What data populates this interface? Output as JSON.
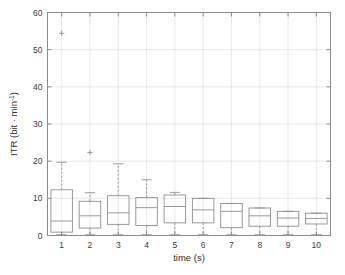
{
  "chart_data": {
    "type": "boxplot",
    "title": "",
    "xlabel": "time (s)",
    "ylabel": "ITR (bit · min⁻¹)",
    "ylabel_parts": {
      "main": "ITR (bit · min",
      "sup": "-1",
      "tail": ")"
    },
    "xlim": [
      0.5,
      10.5
    ],
    "ylim": [
      0,
      60
    ],
    "yticks": [
      0,
      10,
      20,
      30,
      40,
      50,
      60
    ],
    "ytick_labels": [
      "0",
      "10",
      "20",
      "30",
      "40",
      "50",
      "60"
    ],
    "xticks": [
      1,
      2,
      3,
      4,
      5,
      6,
      7,
      8,
      9,
      10
    ],
    "xtick_labels": [
      "1",
      "2",
      "3",
      "4",
      "5",
      "6",
      "7",
      "8",
      "9",
      "10"
    ],
    "grid": true,
    "legend": null,
    "categories": [
      "1",
      "2",
      "3",
      "4",
      "5",
      "6",
      "7",
      "8",
      "9",
      "10"
    ],
    "boxes": [
      {
        "x": 1,
        "whisker_low": 0.2,
        "q1": 0.9,
        "median": 3.9,
        "q3": 12.3,
        "whisker_high": 19.7,
        "outliers": [
          54.4
        ]
      },
      {
        "x": 2,
        "whisker_low": 0.2,
        "q1": 2.0,
        "median": 5.3,
        "q3": 9.2,
        "whisker_high": 11.5,
        "outliers": [
          22.3
        ]
      },
      {
        "x": 3,
        "whisker_low": 0.2,
        "q1": 3.0,
        "median": 6.1,
        "q3": 10.7,
        "whisker_high": 19.3,
        "outliers": []
      },
      {
        "x": 4,
        "whisker_low": 0.2,
        "q1": 2.7,
        "median": 7.5,
        "q3": 10.2,
        "whisker_high": 15.0,
        "outliers": []
      },
      {
        "x": 5,
        "whisker_low": 0.2,
        "q1": 3.4,
        "median": 7.8,
        "q3": 10.9,
        "whisker_high": 11.6,
        "outliers": []
      },
      {
        "x": 6,
        "whisker_low": 0.2,
        "q1": 3.4,
        "median": 6.9,
        "q3": 10.0,
        "whisker_high": 10.0,
        "outliers": []
      },
      {
        "x": 7,
        "whisker_low": 0.2,
        "q1": 2.1,
        "median": 6.5,
        "q3": 8.6,
        "whisker_high": 8.6,
        "outliers": []
      },
      {
        "x": 8,
        "whisker_low": 0.2,
        "q1": 2.5,
        "median": 5.3,
        "q3": 7.4,
        "whisker_high": 7.4,
        "outliers": []
      },
      {
        "x": 9,
        "whisker_low": 0.2,
        "q1": 2.5,
        "median": 4.7,
        "q3": 6.5,
        "whisker_high": 6.5,
        "outliers": []
      },
      {
        "x": 10,
        "whisker_low": 0.2,
        "q1": 3.1,
        "median": 4.6,
        "q3": 6.0,
        "whisker_high": 6.0,
        "outliers": []
      }
    ],
    "colors": {
      "box": "#8f8f8f",
      "median": "#8f8f8f",
      "whisker": "#8f8f8f",
      "outlier": "#8f8f8f",
      "axis": "#8c8c8c",
      "grid": "#e0e0e0",
      "text": "#3b3b3b",
      "background": "#ffffff"
    }
  }
}
